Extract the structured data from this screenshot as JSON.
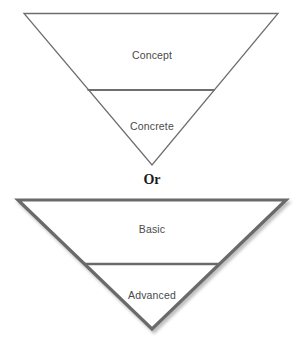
{
  "diagram": {
    "type": "inverted-triangle-funnel-pair",
    "connector_label": "Or",
    "colors": {
      "background": "#ffffff",
      "thin_stroke": "#6e6e6e",
      "thick_stroke": "#6b6b6b",
      "shadow": "#c9c9c9",
      "label_text": "#4a4a4a",
      "connector_text": "#1a1a1a"
    },
    "funnels": [
      {
        "id": "funnel-top",
        "name": "concept-concrete-funnel",
        "stroke_width": 1.2,
        "has_shadow": false,
        "segments": [
          {
            "id": "segment-concept",
            "label": "Concept"
          },
          {
            "id": "segment-concrete",
            "label": "Concrete"
          }
        ]
      },
      {
        "id": "funnel-bottom",
        "name": "basic-advanced-funnel",
        "stroke_width": 3,
        "has_shadow": true,
        "segments": [
          {
            "id": "segment-basic",
            "label": "Basic"
          },
          {
            "id": "segment-advanced",
            "label": "Advanced"
          }
        ]
      }
    ]
  }
}
